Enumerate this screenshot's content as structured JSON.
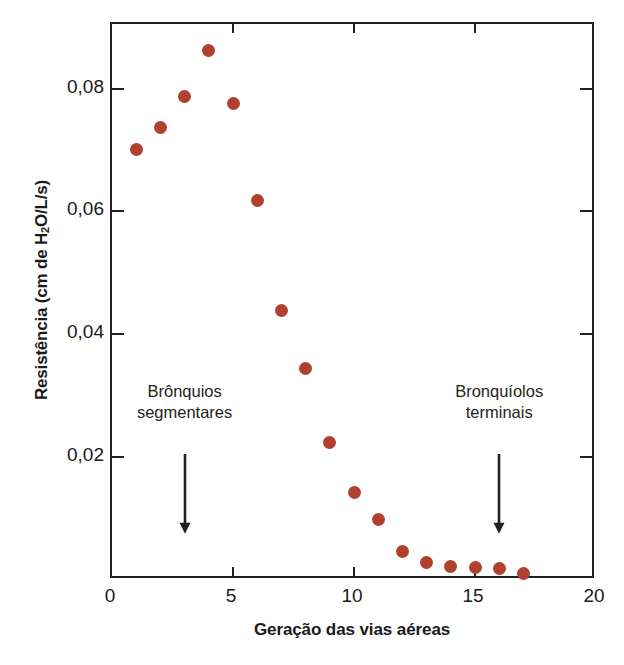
{
  "chart_data": {
    "type": "scatter",
    "title": "",
    "xlabel": "Geração das vias aéreas",
    "ylabel": "Resistência (cm de H₂O/L/s)",
    "ylabel_parts": {
      "prefix": "Resistência (cm de H",
      "subscript": "2",
      "suffix": "O/L/s)"
    },
    "xlim": [
      0,
      20
    ],
    "ylim": [
      0,
      0.0905
    ],
    "grid": false,
    "legend": null,
    "marker_color": "#b0412f",
    "axis_color": "#231f20",
    "x_ticks": [
      0,
      5,
      10,
      15,
      20
    ],
    "x_tick_labels": [
      "0",
      "5",
      "10",
      "15",
      "20"
    ],
    "x_minor_ticks_inward": [
      5,
      10,
      15
    ],
    "y_ticks": [
      0.02,
      0.04,
      0.06,
      0.08
    ],
    "y_tick_labels": [
      "0,02",
      "0,04",
      "0,06",
      "0,08"
    ],
    "x": [
      1,
      2,
      3,
      4,
      5,
      6,
      7,
      8,
      9,
      10,
      11,
      12,
      13,
      14,
      15,
      16,
      17
    ],
    "y": [
      0.07,
      0.0737,
      0.0787,
      0.0862,
      0.0776,
      0.0617,
      0.0438,
      0.0345,
      0.0224,
      0.0143,
      0.0098,
      0.0046,
      0.0029,
      0.0022,
      0.002,
      0.0019,
      0.001
    ],
    "points": [
      {
        "x": 1,
        "y": 0.07
      },
      {
        "x": 2,
        "y": 0.0737
      },
      {
        "x": 3,
        "y": 0.0787
      },
      {
        "x": 4,
        "y": 0.0862
      },
      {
        "x": 5,
        "y": 0.0776
      },
      {
        "x": 6,
        "y": 0.0617
      },
      {
        "x": 7,
        "y": 0.0438
      },
      {
        "x": 8,
        "y": 0.0345
      },
      {
        "x": 9,
        "y": 0.0224
      },
      {
        "x": 10,
        "y": 0.0143
      },
      {
        "x": 11,
        "y": 0.0098
      },
      {
        "x": 12,
        "y": 0.0046
      },
      {
        "x": 13,
        "y": 0.0029
      },
      {
        "x": 14,
        "y": 0.0022
      },
      {
        "x": 15,
        "y": 0.002
      },
      {
        "x": 16,
        "y": 0.0019
      },
      {
        "x": 17,
        "y": 0.001
      }
    ],
    "annotations": [
      {
        "id": "bronquios-segmentares",
        "line1": "Brônquios",
        "line2": "segmentares",
        "x": 3,
        "text_top_y": 0.0255,
        "arrow_from_y": 0.0205,
        "arrow_to_y": 0.0075
      },
      {
        "id": "bronquiolos-terminais",
        "line1": "Bronquíolos",
        "line2": "terminais",
        "x": 16,
        "text_top_y": 0.0255,
        "arrow_from_y": 0.0205,
        "arrow_to_y": 0.0075
      }
    ]
  }
}
